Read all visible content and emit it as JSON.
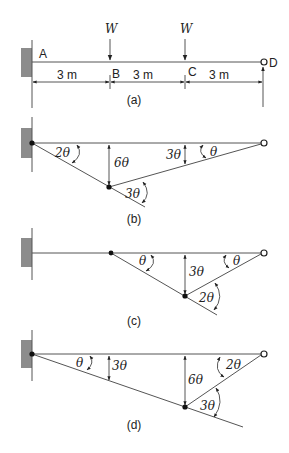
{
  "figure": {
    "panels": [
      {
        "id": "a",
        "caption": "(a)",
        "points": {
          "A": "A",
          "B": "B",
          "C": "C",
          "D": "D"
        },
        "loads": [
          "W",
          "W"
        ],
        "spans": [
          "3 m",
          "3 m",
          "3 m"
        ]
      },
      {
        "id": "b",
        "caption": "(b)",
        "labels": {
          "angle_A": "2θ",
          "deflection_B": "6θ",
          "angle_B": "3θ",
          "deflection_C": "3θ",
          "angle_D": "θ"
        }
      },
      {
        "id": "c",
        "caption": "(c)",
        "labels": {
          "angle_B": "θ",
          "deflection_C": "3θ",
          "angle_D": "θ",
          "angle_C": "2θ"
        }
      },
      {
        "id": "d",
        "caption": "(d)",
        "labels": {
          "angle_A": "θ",
          "deflection_B": "3θ",
          "deflection_C": "6θ",
          "angle_D": "2θ",
          "angle_C": "3θ"
        }
      }
    ]
  }
}
